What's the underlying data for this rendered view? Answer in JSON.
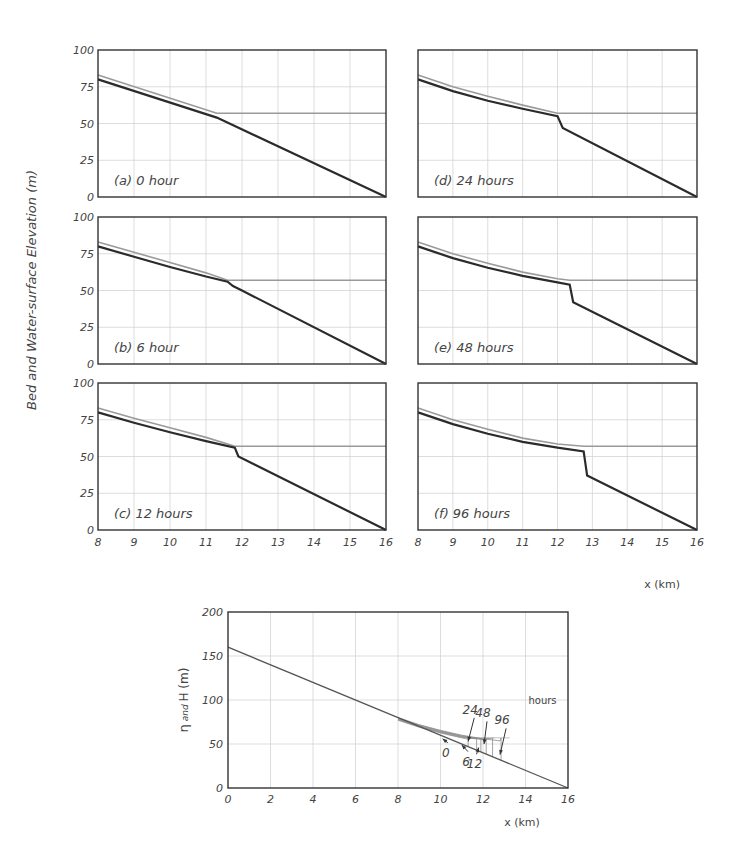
{
  "header": {
    "cropped_text": "- - -   - -   - - - - - - -   - -   - - -"
  },
  "colors": {
    "bed": "#2b2b2b",
    "water": "#9a9a9a",
    "grid": "#cfcfcf",
    "frame": "#333333"
  },
  "chart_data": [
    {
      "type": "line",
      "title": "Bed and water-surface evolution (6 panels)",
      "ylabel": "Bed and Water-surface Elevation (m)",
      "xlabel": "x (km)",
      "xlim": [
        8,
        16
      ],
      "ylim": [
        0,
        100
      ],
      "xticks": [
        "8",
        "9",
        "10",
        "11",
        "12",
        "13",
        "14",
        "15",
        "16"
      ],
      "yticks": [
        "0",
        "25",
        "50",
        "75",
        "100"
      ],
      "grid": true,
      "panels": [
        {
          "id": "a",
          "label": "(a) 0 hour",
          "col": 0,
          "row": 0,
          "bed": [
            [
              8,
              80
            ],
            [
              11.3,
              54
            ],
            [
              16,
              0
            ]
          ],
          "water": [
            [
              8,
              83
            ],
            [
              11.3,
              57
            ],
            [
              16,
              57
            ]
          ]
        },
        {
          "id": "b",
          "label": "(b) 6 hour",
          "col": 0,
          "row": 1,
          "bed": [
            [
              8,
              80
            ],
            [
              9,
              73
            ],
            [
              10,
              66
            ],
            [
              11,
              59.5
            ],
            [
              11.6,
              56
            ],
            [
              11.75,
              53
            ],
            [
              12,
              50
            ],
            [
              16,
              0
            ]
          ],
          "water": [
            [
              8,
              83
            ],
            [
              9,
              76
            ],
            [
              10,
              69
            ],
            [
              11,
              62
            ],
            [
              11.6,
              57
            ],
            [
              16,
              57
            ]
          ]
        },
        {
          "id": "c",
          "label": "(c) 12 hours",
          "col": 0,
          "row": 2,
          "bed": [
            [
              8,
              80
            ],
            [
              9,
              73
            ],
            [
              10,
              66.5
            ],
            [
              11,
              60.5
            ],
            [
              11.8,
              56
            ],
            [
              11.9,
              50
            ],
            [
              16,
              0
            ]
          ],
          "water": [
            [
              8,
              83
            ],
            [
              9,
              76
            ],
            [
              10,
              69.5
            ],
            [
              11,
              63
            ],
            [
              11.8,
              57
            ],
            [
              16,
              57
            ]
          ]
        },
        {
          "id": "d",
          "label": "(d) 24 hours",
          "col": 1,
          "row": 0,
          "bed": [
            [
              8,
              80
            ],
            [
              9,
              72
            ],
            [
              10,
              65.5
            ],
            [
              11,
              60
            ],
            [
              12,
              55
            ],
            [
              12.15,
              47
            ],
            [
              16,
              0
            ]
          ],
          "water": [
            [
              8,
              83
            ],
            [
              9,
              75
            ],
            [
              10,
              68.5
            ],
            [
              11,
              62.5
            ],
            [
              12,
              57
            ],
            [
              16,
              57
            ]
          ]
        },
        {
          "id": "e",
          "label": "(e) 48 hours",
          "col": 1,
          "row": 1,
          "bed": [
            [
              8,
              80
            ],
            [
              9,
              72
            ],
            [
              10,
              65.5
            ],
            [
              11,
              60
            ],
            [
              12,
              55.5
            ],
            [
              12.35,
              54
            ],
            [
              12.45,
              42
            ],
            [
              16,
              0
            ]
          ],
          "water": [
            [
              8,
              83
            ],
            [
              9,
              75
            ],
            [
              10,
              68.5
            ],
            [
              11,
              62.5
            ],
            [
              12,
              58
            ],
            [
              12.35,
              57
            ],
            [
              16,
              57
            ]
          ]
        },
        {
          "id": "f",
          "label": "(f) 96 hours",
          "col": 1,
          "row": 2,
          "bed": [
            [
              8,
              80
            ],
            [
              9,
              72
            ],
            [
              10,
              65.5
            ],
            [
              11,
              60
            ],
            [
              12,
              56
            ],
            [
              12.75,
              53.5
            ],
            [
              12.85,
              37
            ],
            [
              16,
              0
            ]
          ],
          "water": [
            [
              8,
              83
            ],
            [
              9,
              75
            ],
            [
              10,
              68.5
            ],
            [
              11,
              62.5
            ],
            [
              12,
              58.5
            ],
            [
              12.75,
              57
            ],
            [
              16,
              57
            ]
          ]
        }
      ]
    },
    {
      "type": "line",
      "title": "Bed profile overview",
      "ylabel_prefix": "η",
      "ylabel_mid": " and ",
      "ylabel_suffix": "H (m)",
      "xlabel": "x (km)",
      "xlim": [
        0,
        16
      ],
      "ylim": [
        0,
        200
      ],
      "xticks": [
        "0",
        "2",
        "4",
        "6",
        "8",
        "10",
        "12",
        "14",
        "16"
      ],
      "yticks": [
        "0",
        "50",
        "100",
        "150",
        "200"
      ],
      "grid": true,
      "bed": [
        [
          0,
          160
        ],
        [
          16,
          0
        ]
      ],
      "fan_upper": [
        [
          8,
          80
        ],
        [
          9,
          72
        ],
        [
          10,
          65.5
        ],
        [
          11,
          60
        ],
        [
          12,
          56
        ],
        [
          12.8,
          53.5
        ]
      ],
      "steps": [
        {
          "hours": "0",
          "x": 11.3
        },
        {
          "hours": "6",
          "x": 11.7
        },
        {
          "hours": "12",
          "x": 11.9
        },
        {
          "hours": "24",
          "x": 12.15
        },
        {
          "hours": "48",
          "x": 12.45
        },
        {
          "hours": "96",
          "x": 12.85
        }
      ],
      "annotations": [
        {
          "text": "0",
          "tx": 10.25,
          "ty": 40,
          "ax": 10.1,
          "ay": 56
        },
        {
          "text": "6",
          "tx": 11.2,
          "ty": 30,
          "ax": 11.0,
          "ay": 49
        },
        {
          "text": "12",
          "tx": 11.6,
          "ty": 27,
          "ax": 11.8,
          "ay": 46
        },
        {
          "text": "24",
          "tx": 11.4,
          "ty": 82,
          "ax": 11.3,
          "ay": 53
        },
        {
          "text": "48",
          "tx": 12.0,
          "ty": 78,
          "ax": 12.05,
          "ay": 50
        },
        {
          "text": "96",
          "tx": 12.9,
          "ty": 70,
          "ax": 12.8,
          "ay": 38
        }
      ],
      "legend_note": "hours"
    }
  ]
}
